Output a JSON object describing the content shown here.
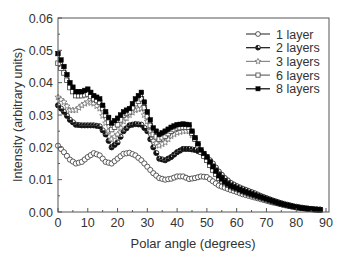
{
  "chart_data": {
    "type": "line",
    "title": "",
    "xlabel": "Polar angle (degrees)",
    "ylabel": "Intensity (arbitrary units)",
    "xlim": [
      0,
      90
    ],
    "ylim": [
      0.0,
      0.06
    ],
    "xticks": [
      0,
      10,
      20,
      30,
      40,
      50,
      60,
      70,
      80,
      90
    ],
    "yticks": [
      "0.00",
      "0.01",
      "0.02",
      "0.03",
      "0.04",
      "0.05",
      "0.06"
    ],
    "grid": false,
    "legend_position": "upper right",
    "x": [
      0,
      2,
      4,
      6,
      8,
      10,
      12,
      14,
      16,
      18,
      20,
      22,
      24,
      26,
      28,
      30,
      32,
      34,
      36,
      38,
      40,
      42,
      44,
      46,
      48,
      50,
      52,
      54,
      56,
      58,
      60,
      62,
      64,
      66,
      68,
      70,
      72,
      74,
      76,
      78,
      80,
      82,
      84,
      86,
      88
    ],
    "series": [
      {
        "name": "1 layer",
        "marker": "open-circle",
        "values": [
          0.0205,
          0.0185,
          0.0162,
          0.015,
          0.0155,
          0.017,
          0.0182,
          0.0175,
          0.0155,
          0.015,
          0.0165,
          0.018,
          0.0183,
          0.0175,
          0.016,
          0.014,
          0.012,
          0.0105,
          0.01,
          0.0103,
          0.011,
          0.011,
          0.0102,
          0.0105,
          0.011,
          0.0108,
          0.0095,
          0.0082,
          0.0075,
          0.0068,
          0.0062,
          0.0055,
          0.005,
          0.0045,
          0.004,
          0.0035,
          0.003,
          0.0026,
          0.0022,
          0.0018,
          0.0015,
          0.0012,
          0.001,
          0.0008,
          0.0007
        ]
      },
      {
        "name": "2 layers",
        "marker": "half-filled-circle",
        "values": [
          0.033,
          0.031,
          0.0285,
          0.027,
          0.0268,
          0.0268,
          0.0268,
          0.0265,
          0.024,
          0.02,
          0.0215,
          0.025,
          0.0268,
          0.0272,
          0.027,
          0.025,
          0.02,
          0.0165,
          0.016,
          0.017,
          0.0185,
          0.0195,
          0.0195,
          0.0192,
          0.0185,
          0.017,
          0.015,
          0.0125,
          0.0105,
          0.009,
          0.008,
          0.0072,
          0.0065,
          0.0058,
          0.005,
          0.0043,
          0.0036,
          0.003,
          0.0025,
          0.002,
          0.0016,
          0.0013,
          0.001,
          0.0008,
          0.0007
        ]
      },
      {
        "name": "3 layers",
        "marker": "open-star",
        "values": [
          0.0355,
          0.034,
          0.0315,
          0.0315,
          0.033,
          0.034,
          0.0335,
          0.032,
          0.0275,
          0.0225,
          0.024,
          0.028,
          0.03,
          0.0315,
          0.032,
          0.028,
          0.022,
          0.0205,
          0.0215,
          0.0235,
          0.0245,
          0.025,
          0.025,
          0.0225,
          0.019,
          0.016,
          0.013,
          0.0105,
          0.009,
          0.008,
          0.0073,
          0.0065,
          0.0058,
          0.0051,
          0.0045,
          0.0039,
          0.0033,
          0.0028,
          0.0023,
          0.0019,
          0.0015,
          0.0012,
          0.001,
          0.0008,
          0.0007
        ]
      },
      {
        "name": "6 layers",
        "marker": "open-square",
        "values": [
          0.046,
          0.043,
          0.0385,
          0.036,
          0.036,
          0.0365,
          0.035,
          0.034,
          0.03,
          0.0255,
          0.027,
          0.03,
          0.031,
          0.0335,
          0.035,
          0.0295,
          0.024,
          0.0225,
          0.0235,
          0.025,
          0.026,
          0.0262,
          0.0262,
          0.0225,
          0.0185,
          0.016,
          0.013,
          0.0105,
          0.0088,
          0.0078,
          0.007,
          0.0063,
          0.0056,
          0.005,
          0.0044,
          0.0038,
          0.0032,
          0.0027,
          0.0022,
          0.0018,
          0.0015,
          0.0012,
          0.001,
          0.0008,
          0.0007
        ]
      },
      {
        "name": "8 layers",
        "marker": "filled-square",
        "values": [
          0.049,
          0.045,
          0.04,
          0.0372,
          0.0372,
          0.038,
          0.036,
          0.035,
          0.031,
          0.0275,
          0.029,
          0.031,
          0.032,
          0.035,
          0.037,
          0.031,
          0.026,
          0.024,
          0.025,
          0.0262,
          0.027,
          0.0272,
          0.027,
          0.023,
          0.0192,
          0.017,
          0.014,
          0.0112,
          0.0092,
          0.008,
          0.0073,
          0.0065,
          0.0058,
          0.0052,
          0.0046,
          0.004,
          0.0034,
          0.0028,
          0.0023,
          0.0019,
          0.0015,
          0.0012,
          0.001,
          0.0008,
          0.0007
        ]
      }
    ]
  },
  "style": {
    "axis_color": "#555555",
    "text_color": "#333333",
    "line_colors": [
      "#444444",
      "#111111",
      "#888888",
      "#666666",
      "#000000"
    ]
  }
}
